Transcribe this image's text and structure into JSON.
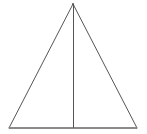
{
  "figure": {
    "type": "geometric-diagram",
    "canvas": {
      "width": 147,
      "height": 134,
      "background_color": "#ffffff"
    },
    "style": {
      "side_stroke_color": "#555555",
      "base_stroke_color": "#8a8a8a",
      "median_stroke_color": "#555555",
      "stroke_width": 1,
      "fill": "none"
    },
    "points": {
      "apex": {
        "label": "",
        "x": 73,
        "y": 4
      },
      "bottom_left": {
        "label": "",
        "x": 9,
        "y": 128
      },
      "bottom_right": {
        "label": "",
        "x": 137,
        "y": 128
      },
      "base_midpoint": {
        "label": "",
        "x": 73,
        "y": 128
      }
    },
    "segments": [
      {
        "name": "left-side",
        "from": "apex",
        "to": "bottom_left"
      },
      {
        "name": "right-side",
        "from": "apex",
        "to": "bottom_right"
      },
      {
        "name": "base",
        "from": "bottom_left",
        "to": "bottom_right"
      },
      {
        "name": "altitude",
        "from": "apex",
        "to": "base_midpoint"
      }
    ],
    "labels": [],
    "annotations": []
  }
}
